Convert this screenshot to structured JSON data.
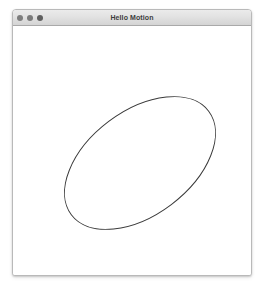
{
  "window": {
    "title": "Hello Motion",
    "controls": [
      {
        "name": "close",
        "label": "Close",
        "color": "#7d7d7d"
      },
      {
        "name": "minimize",
        "label": "Minimize",
        "color": "#7a7a7a"
      },
      {
        "name": "zoom",
        "label": "Zoom",
        "color": "#5f5f5f"
      }
    ],
    "frame": {
      "border_color": "#b9b9b9",
      "titlebar_top_color": "#ebebeb",
      "titlebar_bottom_color": "#d4d4d4",
      "content_background": "#ffffff"
    }
  },
  "canvas": {
    "background": "#ffffff",
    "shapes": [
      {
        "name": "ellipse",
        "type": "ellipse",
        "stroke_color": "#3a3a3a",
        "stroke_width": 1,
        "fill": "none",
        "center_x": 127,
        "center_y": 137,
        "radius_x": 86,
        "radius_y": 52,
        "rotation_degrees": -37
      }
    ]
  }
}
